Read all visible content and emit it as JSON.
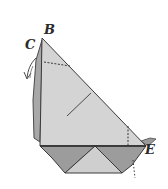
{
  "diagram": {
    "type": "origami-fold-step",
    "labels": {
      "b": "B",
      "c": "C",
      "e": "E"
    },
    "colors": {
      "paper_light": "#d6d6d6",
      "paper_mid": "#c4c4c4",
      "paper_dark": "#9a9a9a",
      "line": "#3a3a3a"
    }
  }
}
